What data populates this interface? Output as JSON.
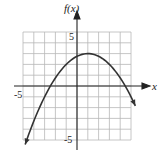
{
  "chart_data": {
    "type": "line",
    "title": "",
    "xlabel": "x",
    "ylabel": "f(x)",
    "xlim": [
      -5,
      5
    ],
    "ylim": [
      -5,
      5
    ],
    "grid": true,
    "x_tick_labels": [
      "-5"
    ],
    "y_tick_labels": [
      "5",
      "-5"
    ],
    "series": [
      {
        "name": "f(x)",
        "description": "downward-opening parabola, vertex (1, 3), arrows at both ends",
        "x": [
          -4.8,
          -4,
          -3,
          -2,
          -1,
          0,
          1,
          2,
          3,
          4,
          5,
          5.4
        ],
        "values": [
          -5.4,
          -3.25,
          -1.0,
          0.75,
          2.0,
          2.75,
          3.0,
          2.75,
          2.0,
          0.75,
          -1.0,
          -1.84
        ]
      }
    ]
  },
  "labels": {
    "y_axis": "f(x)",
    "x_axis": "x",
    "y_top": "5",
    "y_bottom": "-5",
    "x_left": "-5"
  }
}
